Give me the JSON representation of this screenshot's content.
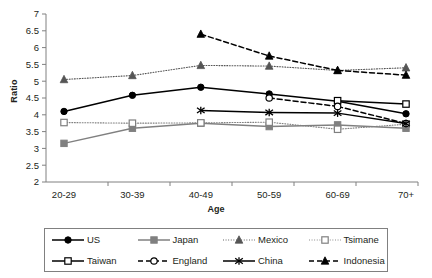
{
  "chart_data": {
    "type": "line",
    "title": "",
    "xlabel": "Age",
    "ylabel": "Ratio",
    "categories": [
      "20-29",
      "30-39",
      "40-49",
      "50-59",
      "60-69",
      "70+"
    ],
    "ylim": [
      2,
      7
    ],
    "yticks": [
      "2",
      "2.5",
      "3",
      "3.5",
      "4",
      "4.5",
      "5",
      "5.5",
      "6",
      "6.5",
      "7"
    ],
    "ytick_step": 0.5,
    "grid": false,
    "legend_position": "bottom",
    "series": [
      {
        "name": "US",
        "values": [
          4.1,
          4.58,
          4.82,
          4.62,
          4.4,
          4.03
        ],
        "marker": "filled-circle",
        "line": "solid",
        "color": "#000000"
      },
      {
        "name": "Japan",
        "values": [
          3.15,
          3.6,
          3.75,
          3.65,
          3.7,
          3.6
        ],
        "marker": "filled-square",
        "line": "solid",
        "color": "#808080"
      },
      {
        "name": "Mexico",
        "values": [
          5.05,
          5.17,
          5.47,
          5.45,
          5.32,
          5.4
        ],
        "marker": "filled-triangle",
        "line": "dotted",
        "color": "#555555"
      },
      {
        "name": "Tsimane",
        "values": [
          3.77,
          3.75,
          3.76,
          3.78,
          3.57,
          3.72
        ],
        "marker": "open-square",
        "line": "dotted",
        "color": "#808080"
      },
      {
        "name": "Taiwan",
        "values": [
          null,
          null,
          null,
          null,
          4.42,
          4.32
        ],
        "marker": "open-square",
        "line": "solid",
        "color": "#000000"
      },
      {
        "name": "England",
        "values": [
          null,
          null,
          null,
          4.5,
          4.25,
          3.74
        ],
        "marker": "open-circle",
        "line": "dashed",
        "color": "#000000"
      },
      {
        "name": "China",
        "values": [
          null,
          null,
          4.13,
          4.07,
          4.05,
          3.74
        ],
        "marker": "asterisk",
        "line": "solid",
        "color": "#000000"
      },
      {
        "name": "Indonesia",
        "values": [
          null,
          null,
          6.4,
          5.75,
          5.32,
          5.18
        ],
        "marker": "filled-triangle",
        "line": "dashed",
        "color": "#000000"
      }
    ]
  },
  "legend": {
    "entries": [
      {
        "label": "US"
      },
      {
        "label": "Japan"
      },
      {
        "label": "Mexico"
      },
      {
        "label": "Tsimane"
      },
      {
        "label": "Taiwan"
      },
      {
        "label": "England"
      },
      {
        "label": "China"
      },
      {
        "label": "Indonesia"
      }
    ]
  }
}
